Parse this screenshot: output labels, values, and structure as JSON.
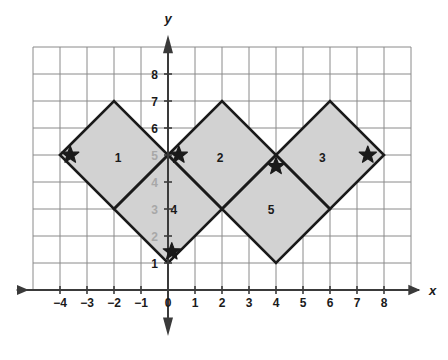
{
  "figure": {
    "type": "coordinate-plane-diagram",
    "title": "",
    "background_color": "#ffffff"
  },
  "axes": {
    "x_axis_label": "x",
    "y_axis_label": "y",
    "x_tick_labels": [
      "-4",
      "-3",
      "-2",
      "-1",
      "0",
      "1",
      "2",
      "3",
      "4",
      "5",
      "6",
      "7",
      "8"
    ],
    "x_tick_values": [
      -4,
      -3,
      -2,
      -1,
      0,
      1,
      2,
      3,
      4,
      5,
      6,
      7,
      8
    ],
    "y_tick_labels": [
      "1",
      "2",
      "3",
      "4",
      "5",
      "6",
      "7",
      "8"
    ],
    "y_tick_values": [
      1,
      2,
      3,
      4,
      5,
      6,
      7,
      8
    ],
    "y_tick_dimmed": [
      false,
      true,
      true,
      true,
      true,
      false,
      false,
      false
    ],
    "origin_label": "0",
    "x_range": [
      -5,
      9
    ],
    "y_range": [
      -1,
      9
    ],
    "grid_x_min": -5,
    "grid_x_max": 9,
    "grid_y_min": 0,
    "grid_y_max": 9,
    "grid_color": "#8a8a8a",
    "axis_color": "#3a3a3a",
    "grid_spacing_units": 1
  },
  "shapes": {
    "fill_color": "#d2d2d2",
    "stroke_color": "#1a1a1a",
    "stroke_width": 2.6,
    "regions": [
      {
        "label": "1",
        "label_position": {
          "x": -1.85,
          "y": 4.73
        },
        "vertices": [
          [
            -4,
            5
          ],
          [
            -2,
            7
          ],
          [
            0,
            5
          ],
          [
            -2,
            3
          ]
        ]
      },
      {
        "label": "2",
        "label_position": {
          "x": 1.93,
          "y": 4.73
        },
        "vertices": [
          [
            0,
            5
          ],
          [
            2,
            7
          ],
          [
            4,
            5
          ],
          [
            2,
            3
          ]
        ]
      },
      {
        "label": "3",
        "label_position": {
          "x": 5.72,
          "y": 4.73
        },
        "vertices": [
          [
            4,
            5
          ],
          [
            6,
            7
          ],
          [
            8,
            5
          ],
          [
            6,
            3
          ]
        ]
      },
      {
        "label": "4",
        "label_position": {
          "x": 0.22,
          "y": 2.82
        },
        "vertices": [
          [
            -2,
            3
          ],
          [
            0,
            5
          ],
          [
            2,
            3
          ],
          [
            0,
            1
          ]
        ]
      },
      {
        "label": "5",
        "label_position": {
          "x": 3.82,
          "y": 2.82
        },
        "vertices": [
          [
            2,
            3
          ],
          [
            4,
            5
          ],
          [
            6,
            3
          ],
          [
            4,
            1
          ]
        ]
      }
    ]
  },
  "stars": {
    "color": "#1a1a1a",
    "size_px": 9,
    "points": [
      {
        "name": "star-region-1-left",
        "x": -3.62,
        "y": 5.0
      },
      {
        "name": "star-origin-right",
        "x": 0.4,
        "y": 5.0
      },
      {
        "name": "star-region-5-top",
        "x": 4.0,
        "y": 4.58
      },
      {
        "name": "star-region-3-right",
        "x": 7.4,
        "y": 5.0
      },
      {
        "name": "star-region-4-bottom",
        "x": 0.14,
        "y": 1.42
      }
    ]
  },
  "chart_data": {
    "type": "scatter",
    "title": "",
    "xlabel": "x",
    "ylabel": "y",
    "xlim": [
      -5,
      9
    ],
    "ylim": [
      -1,
      9
    ],
    "grid": true,
    "legend": "none",
    "annotations": [
      "1",
      "2",
      "3",
      "4",
      "5"
    ],
    "series": [
      {
        "name": "star-markers",
        "x": [
          -3.62,
          0.4,
          4.0,
          7.4,
          0.14
        ],
        "y": [
          5.0,
          5.0,
          4.58,
          5.0,
          1.42
        ]
      }
    ],
    "polygons": [
      {
        "name": "1",
        "vertices": [
          [
            -4,
            5
          ],
          [
            -2,
            7
          ],
          [
            0,
            5
          ],
          [
            -2,
            3
          ]
        ]
      },
      {
        "name": "2",
        "vertices": [
          [
            0,
            5
          ],
          [
            2,
            7
          ],
          [
            4,
            5
          ],
          [
            2,
            3
          ]
        ]
      },
      {
        "name": "3",
        "vertices": [
          [
            4,
            5
          ],
          [
            6,
            7
          ],
          [
            8,
            5
          ],
          [
            6,
            3
          ]
        ]
      },
      {
        "name": "4",
        "vertices": [
          [
            -2,
            3
          ],
          [
            0,
            5
          ],
          [
            2,
            3
          ],
          [
            0,
            1
          ]
        ]
      },
      {
        "name": "5",
        "vertices": [
          [
            2,
            3
          ],
          [
            4,
            5
          ],
          [
            6,
            3
          ],
          [
            4,
            1
          ]
        ]
      }
    ]
  }
}
